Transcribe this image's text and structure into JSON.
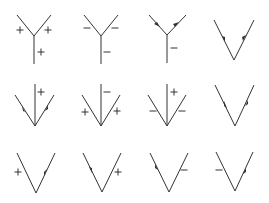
{
  "diagram": {
    "colors": {
      "line": "#333333",
      "background": "#ffffff"
    },
    "rows": [
      [
        {
          "id": "r1c1",
          "type": "Y-vertex",
          "labels": [
            "+",
            "+",
            "+"
          ],
          "arrows": []
        },
        {
          "id": "r1c2",
          "type": "Y-vertex",
          "labels": [
            "-",
            "-",
            "-"
          ],
          "arrows": []
        },
        {
          "id": "r1c3",
          "type": "Y-vertex",
          "labels": [
            "-"
          ],
          "arrows": [
            "left-arm-in",
            "right-arm-out"
          ]
        },
        {
          "id": "r1c4",
          "type": "V-vertex",
          "labels": [],
          "arrows": [
            "left-arm-in",
            "right-arm-out"
          ]
        }
      ],
      [
        {
          "id": "r2c1",
          "type": "V-with-stem",
          "labels": [
            "+"
          ],
          "arrows": [
            "left-arm-out",
            "right-arm-in"
          ]
        },
        {
          "id": "r2c2",
          "type": "V-with-stem",
          "labels": [
            "-",
            "+",
            "+"
          ],
          "arrows": []
        },
        {
          "id": "r2c3",
          "type": "V-with-stem",
          "labels": [
            "+",
            "-",
            "-"
          ],
          "arrows": []
        },
        {
          "id": "r2c4",
          "type": "V-vertex",
          "labels": [],
          "arrows": [
            "left-arm-out",
            "right-arm-in"
          ]
        }
      ],
      [
        {
          "id": "r3c1",
          "type": "V-vertex",
          "labels": [
            "+"
          ],
          "arrows": [
            "right-arm-out"
          ]
        },
        {
          "id": "r3c2",
          "type": "V-vertex",
          "labels": [
            "+"
          ],
          "arrows": [
            "left-arm-in"
          ]
        },
        {
          "id": "r3c3",
          "type": "V-vertex",
          "labels": [
            "-"
          ],
          "arrows": [
            "left-arm-out"
          ]
        },
        {
          "id": "r3c4",
          "type": "V-vertex",
          "labels": [
            "-"
          ],
          "arrows": [
            "right-arm-in"
          ]
        }
      ]
    ]
  }
}
